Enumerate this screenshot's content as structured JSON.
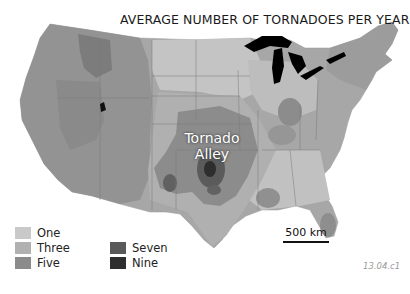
{
  "title": "AVERAGE NUMBER OF TORNADOES PER YEAR",
  "annotation": {
    "line1": "Tornado",
    "line2": "Alley"
  },
  "legend": {
    "items": [
      {
        "label": "One",
        "color": "#c9c9c9"
      },
      {
        "label": "Three",
        "color": "#b1b1b1"
      },
      {
        "label": "Five",
        "color": "#8b8b8b"
      },
      {
        "label": "Seven",
        "color": "#595959"
      },
      {
        "label": "Nine",
        "color": "#2e2e2e"
      }
    ]
  },
  "scale_bar": {
    "label": "500 km"
  },
  "figure_id": "13.04.c1",
  "colors": {
    "land_base": "#a8a8a8",
    "west_terrain": "#8f8f8f",
    "lakes": "#000000",
    "background": "#ffffff"
  }
}
